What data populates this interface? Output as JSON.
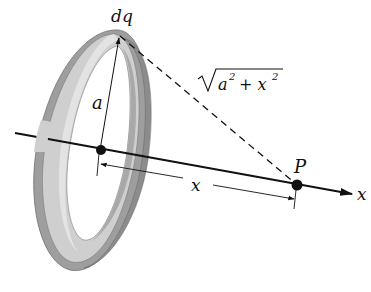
{
  "diagram": {
    "labels": {
      "charge_element": "dq",
      "radius": "a",
      "distance_expr_base": "a",
      "distance_expr_plus": "+ x",
      "distance_exp": "2",
      "point": "P",
      "axial_distance": "x",
      "axis_name": "x"
    },
    "elements": [
      {
        "name": "ring",
        "kind": "shaded torus seen in perspective"
      },
      {
        "name": "x-axis",
        "kind": "line with arrowhead to the right"
      },
      {
        "name": "center-point",
        "kind": "filled dot at ring center"
      },
      {
        "name": "point-P",
        "kind": "filled dot on axis"
      },
      {
        "name": "radius-arrow",
        "kind": "arrow from center up to dq"
      },
      {
        "name": "distance-line",
        "kind": "dashed line from dq to P"
      },
      {
        "name": "x-dimension",
        "kind": "double-headed dimension arrow from center to P"
      }
    ],
    "colors": {
      "ring_light": "#d6d6d6",
      "ring_mid": "#b3b3b3",
      "ring_dark": "#8f8f8f",
      "ink": "#111111",
      "background": "#ffffff"
    }
  }
}
